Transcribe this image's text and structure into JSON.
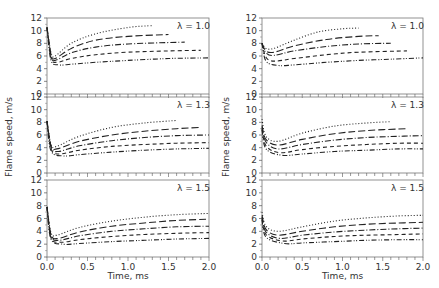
{
  "chart_data": {
    "type": "line",
    "layout": {
      "columns": 2,
      "rows": 3
    },
    "xlabel": "Time, ms",
    "ylabel": "Flame speed, m/s",
    "xlim": [
      0,
      2.0
    ],
    "ylim": [
      0,
      12
    ],
    "xticks": [
      "0.0",
      "0.5",
      "1.0",
      "1.5",
      "2.0"
    ],
    "yticks": [
      "0",
      "2",
      "4",
      "6",
      "8",
      "10",
      "12"
    ],
    "grid": false,
    "line_styles": [
      "dotted",
      "long-dash",
      "dash-dot",
      "dash",
      "dash-dot-dot"
    ],
    "panels": [
      {
        "col": 0,
        "row": 0,
        "annotation": "λ = 1.0",
        "series": [
          {
            "style": "dotted",
            "x": [
              0.0,
              0.05,
              0.1,
              0.3,
              0.6,
              1.0,
              1.3
            ],
            "y": [
              10.5,
              6.5,
              6.0,
              8.0,
              9.5,
              10.5,
              10.8
            ]
          },
          {
            "style": "long-dash",
            "x": [
              0.0,
              0.05,
              0.1,
              0.3,
              0.6,
              1.0,
              1.5
            ],
            "y": [
              10.5,
              6.2,
              5.6,
              7.2,
              8.5,
              9.1,
              9.4
            ]
          },
          {
            "style": "dash-dot",
            "x": [
              0.0,
              0.05,
              0.1,
              0.3,
              0.6,
              1.0,
              1.7
            ],
            "y": [
              10.5,
              6.0,
              5.3,
              6.5,
              7.4,
              7.9,
              8.2
            ]
          },
          {
            "style": "dash",
            "x": [
              0.0,
              0.05,
              0.12,
              0.3,
              0.6,
              1.0,
              1.5,
              1.9
            ],
            "y": [
              10.5,
              5.7,
              5.0,
              5.6,
              6.2,
              6.6,
              6.8,
              6.9
            ]
          },
          {
            "style": "dash-dot-dot",
            "x": [
              0.0,
              0.05,
              0.15,
              0.3,
              0.6,
              1.0,
              1.5,
              2.0
            ],
            "y": [
              10.5,
              5.3,
              4.6,
              4.7,
              5.0,
              5.3,
              5.6,
              5.7
            ]
          }
        ]
      },
      {
        "col": 0,
        "row": 1,
        "annotation": "λ = 1.3",
        "series": [
          {
            "style": "dotted",
            "x": [
              0.0,
              0.05,
              0.12,
              0.4,
              0.8,
              1.2,
              1.6
            ],
            "y": [
              8.2,
              4.5,
              4.2,
              5.8,
              7.2,
              7.9,
              8.3
            ]
          },
          {
            "style": "long-dash",
            "x": [
              0.0,
              0.05,
              0.12,
              0.4,
              0.8,
              1.2,
              1.6,
              1.9
            ],
            "y": [
              8.2,
              4.3,
              3.8,
              5.0,
              6.0,
              6.6,
              7.0,
              7.2
            ]
          },
          {
            "style": "dash-dot",
            "x": [
              0.0,
              0.05,
              0.14,
              0.4,
              0.8,
              1.2,
              1.6,
              2.0
            ],
            "y": [
              8.2,
              4.1,
              3.4,
              4.3,
              5.1,
              5.6,
              5.9,
              6.0
            ]
          },
          {
            "style": "dash",
            "x": [
              0.0,
              0.05,
              0.15,
              0.4,
              0.8,
              1.2,
              1.6,
              2.0
            ],
            "y": [
              8.2,
              3.8,
              3.0,
              3.6,
              4.2,
              4.5,
              4.7,
              4.8
            ]
          },
          {
            "style": "dash-dot-dot",
            "x": [
              0.0,
              0.05,
              0.2,
              0.4,
              0.8,
              1.2,
              1.6,
              2.0
            ],
            "y": [
              8.2,
              3.5,
              2.7,
              2.9,
              3.3,
              3.6,
              3.8,
              3.9
            ]
          }
        ]
      },
      {
        "col": 0,
        "row": 2,
        "annotation": "λ = 1.5",
        "series": [
          {
            "style": "dotted",
            "x": [
              0.0,
              0.05,
              0.12,
              0.4,
              0.8,
              1.2,
              1.6,
              2.0
            ],
            "y": [
              7.8,
              3.8,
              3.4,
              4.6,
              5.6,
              6.2,
              6.6,
              6.8
            ]
          },
          {
            "style": "long-dash",
            "x": [
              0.0,
              0.05,
              0.14,
              0.4,
              0.8,
              1.2,
              1.6,
              2.0
            ],
            "y": [
              7.8,
              3.5,
              2.9,
              3.9,
              4.8,
              5.3,
              5.7,
              5.9
            ]
          },
          {
            "style": "dash-dot",
            "x": [
              0.0,
              0.05,
              0.15,
              0.4,
              0.8,
              1.2,
              1.6,
              2.0
            ],
            "y": [
              7.8,
              3.3,
              2.6,
              3.3,
              4.0,
              4.4,
              4.7,
              4.8
            ]
          },
          {
            "style": "dash",
            "x": [
              0.0,
              0.05,
              0.17,
              0.4,
              0.8,
              1.2,
              1.6,
              2.0
            ],
            "y": [
              7.8,
              3.0,
              2.3,
              2.7,
              3.2,
              3.5,
              3.7,
              3.8
            ]
          },
          {
            "style": "dash-dot-dot",
            "x": [
              0.0,
              0.05,
              0.2,
              0.4,
              0.8,
              1.2,
              1.6,
              2.0
            ],
            "y": [
              7.8,
              2.8,
              2.0,
              2.1,
              2.4,
              2.6,
              2.8,
              2.9
            ]
          }
        ]
      },
      {
        "col": 1,
        "row": 0,
        "annotation": "λ = 1.0",
        "series": [
          {
            "style": "dotted",
            "x": [
              0.0,
              0.05,
              0.15,
              0.4,
              0.7,
              1.0,
              1.2
            ],
            "y": [
              8.0,
              7.2,
              7.2,
              8.5,
              9.8,
              10.3,
              10.4
            ]
          },
          {
            "style": "long-dash",
            "x": [
              0.0,
              0.05,
              0.15,
              0.4,
              0.8,
              1.2,
              1.45
            ],
            "y": [
              8.0,
              6.8,
              6.6,
              7.6,
              8.6,
              9.1,
              9.2
            ]
          },
          {
            "style": "dash-dot",
            "x": [
              0.0,
              0.05,
              0.15,
              0.4,
              0.8,
              1.2,
              1.6
            ],
            "y": [
              8.0,
              6.5,
              6.1,
              6.8,
              7.5,
              7.9,
              8.0
            ]
          },
          {
            "style": "dash",
            "x": [
              0.0,
              0.05,
              0.15,
              0.4,
              0.8,
              1.2,
              1.8
            ],
            "y": [
              8.0,
              5.8,
              5.2,
              5.6,
              6.2,
              6.6,
              6.8
            ]
          },
          {
            "style": "dash-dot-dot",
            "x": [
              0.0,
              0.05,
              0.2,
              0.4,
              0.8,
              1.2,
              1.6,
              2.0
            ],
            "y": [
              8.0,
              5.2,
              4.5,
              4.6,
              5.0,
              5.3,
              5.5,
              5.7
            ]
          }
        ]
      },
      {
        "col": 1,
        "row": 1,
        "annotation": "λ = 1.3",
        "series": [
          {
            "style": "dotted",
            "x": [
              0.0,
              0.05,
              0.2,
              0.5,
              0.9,
              1.3,
              1.6
            ],
            "y": [
              8.5,
              5.8,
              5.0,
              6.3,
              7.4,
              7.9,
              8.1
            ]
          },
          {
            "style": "long-dash",
            "x": [
              0.0,
              0.05,
              0.2,
              0.5,
              0.9,
              1.3,
              1.8
            ],
            "y": [
              7.5,
              5.3,
              4.4,
              5.3,
              6.2,
              6.7,
              7.0
            ]
          },
          {
            "style": "dash-dot",
            "x": [
              0.0,
              0.05,
              0.2,
              0.5,
              0.9,
              1.3,
              1.7,
              2.0
            ],
            "y": [
              7.2,
              4.9,
              3.8,
              4.5,
              5.2,
              5.6,
              5.8,
              5.9
            ]
          },
          {
            "style": "dash",
            "x": [
              0.0,
              0.05,
              0.22,
              0.5,
              0.9,
              1.3,
              1.7,
              2.0
            ],
            "y": [
              7.0,
              4.3,
              3.2,
              3.7,
              4.2,
              4.5,
              4.7,
              4.7
            ]
          },
          {
            "style": "dash-dot-dot",
            "x": [
              0.0,
              0.05,
              0.25,
              0.5,
              0.9,
              1.3,
              1.7,
              2.0
            ],
            "y": [
              6.8,
              3.8,
              2.8,
              3.0,
              3.4,
              3.6,
              3.8,
              3.8
            ]
          }
        ]
      },
      {
        "col": 1,
        "row": 2,
        "annotation": "λ = 1.5",
        "series": [
          {
            "style": "dotted",
            "x": [
              0.0,
              0.05,
              0.2,
              0.5,
              0.9,
              1.3,
              1.7,
              2.0
            ],
            "y": [
              7.0,
              4.8,
              4.0,
              4.7,
              5.6,
              6.1,
              6.4,
              6.5
            ]
          },
          {
            "style": "long-dash",
            "x": [
              0.0,
              0.05,
              0.2,
              0.5,
              0.9,
              1.3,
              1.7,
              2.0
            ],
            "y": [
              6.5,
              4.3,
              3.4,
              4.0,
              4.7,
              5.1,
              5.3,
              5.4
            ]
          },
          {
            "style": "dash-dot",
            "x": [
              0.0,
              0.05,
              0.22,
              0.5,
              0.9,
              1.3,
              1.7,
              2.0
            ],
            "y": [
              6.2,
              3.9,
              2.9,
              3.4,
              3.9,
              4.2,
              4.4,
              4.5
            ]
          },
          {
            "style": "dash",
            "x": [
              0.0,
              0.05,
              0.25,
              0.5,
              0.9,
              1.3,
              1.7,
              2.0
            ],
            "y": [
              6.0,
              3.5,
              2.5,
              2.8,
              3.2,
              3.4,
              3.5,
              3.6
            ]
          },
          {
            "style": "dash-dot-dot",
            "x": [
              0.0,
              0.05,
              0.28,
              0.5,
              0.9,
              1.3,
              1.7,
              2.0
            ],
            "y": [
              5.8,
              3.1,
              2.1,
              2.2,
              2.4,
              2.6,
              2.7,
              2.7
            ]
          }
        ]
      }
    ]
  }
}
